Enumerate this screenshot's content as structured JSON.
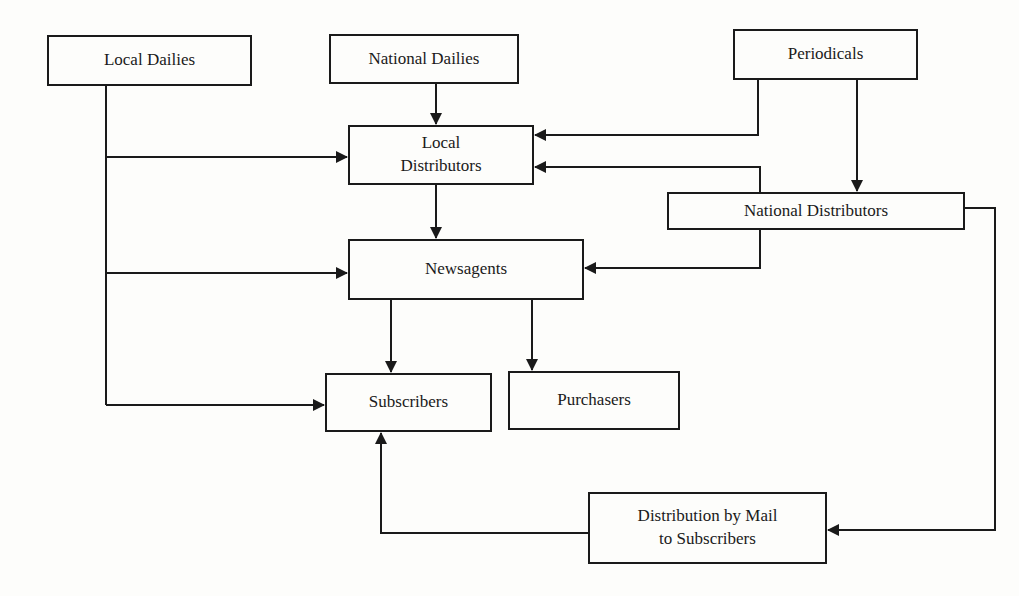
{
  "diagram": {
    "type": "flowchart",
    "title": "",
    "nodes": {
      "local_dailies": {
        "label": "Local Dailies"
      },
      "national_dailies": {
        "label": "National Dailies"
      },
      "periodicals": {
        "label": "Periodicals"
      },
      "local_distributors": {
        "line1": "Local",
        "line2": "Distributors"
      },
      "national_distributors": {
        "label": "National Distributors"
      },
      "newsagents": {
        "label": "Newsagents"
      },
      "subscribers": {
        "label": "Subscribers"
      },
      "purchasers": {
        "label": "Purchasers"
      },
      "mail_distribution": {
        "line1": "Distribution by Mail",
        "line2": "to Subscribers"
      }
    },
    "edges": [
      {
        "from": "Local Dailies",
        "to": "Local Distributors"
      },
      {
        "from": "Local Dailies",
        "to": "Newsagents"
      },
      {
        "from": "Local Dailies",
        "to": "Subscribers"
      },
      {
        "from": "National Dailies",
        "to": "Local Distributors"
      },
      {
        "from": "Periodicals",
        "to": "Local Distributors"
      },
      {
        "from": "Periodicals",
        "to": "National Distributors"
      },
      {
        "from": "National Distributors",
        "to": "Local Distributors"
      },
      {
        "from": "National Distributors",
        "to": "Newsagents"
      },
      {
        "from": "National Distributors",
        "to": "Distribution by Mail to Subscribers"
      },
      {
        "from": "Local Distributors",
        "to": "Newsagents"
      },
      {
        "from": "Newsagents",
        "to": "Subscribers"
      },
      {
        "from": "Newsagents",
        "to": "Purchasers"
      },
      {
        "from": "Distribution by Mail to Subscribers",
        "to": "Subscribers"
      }
    ],
    "colors": {
      "line": "#1a1a1a",
      "background": "#fdfdfb"
    }
  }
}
